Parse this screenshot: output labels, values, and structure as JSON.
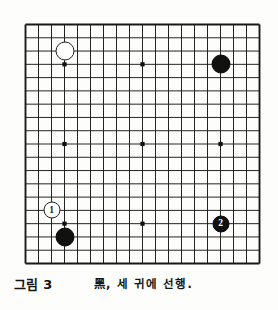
{
  "figure": {
    "caption_number": "그림 3",
    "caption_text": "黑, 세 귀에 선행.",
    "board_type": "go-board",
    "board_size": 19,
    "ink_color": "#141414",
    "paper_color": "#fdfdfb"
  },
  "board": {
    "columns": 19,
    "rows": 19,
    "star_points": [
      {
        "col": 3,
        "row": 3
      },
      {
        "col": 9,
        "row": 3
      },
      {
        "col": 15,
        "row": 3
      },
      {
        "col": 3,
        "row": 9
      },
      {
        "col": 9,
        "row": 9
      },
      {
        "col": 15,
        "row": 9
      },
      {
        "col": 3,
        "row": 15
      },
      {
        "col": 9,
        "row": 15
      },
      {
        "col": 15,
        "row": 15
      }
    ],
    "stones": [
      {
        "id": "white-upper-left",
        "color": "white",
        "col": 3,
        "row": 2,
        "label": "",
        "radius": 9.5
      },
      {
        "id": "black-upper-right",
        "color": "black",
        "col": 15,
        "row": 3,
        "label": "",
        "radius": 9.5
      },
      {
        "id": "white-move-1",
        "color": "white",
        "col": 2,
        "row": 14,
        "label": "1",
        "radius": 8.5
      },
      {
        "id": "black-lower-left",
        "color": "black",
        "col": 3,
        "row": 16,
        "label": "",
        "radius": 9.5
      },
      {
        "id": "black-move-2",
        "color": "black",
        "col": 15,
        "row": 15,
        "label": "2",
        "radius": 8.5
      }
    ]
  }
}
